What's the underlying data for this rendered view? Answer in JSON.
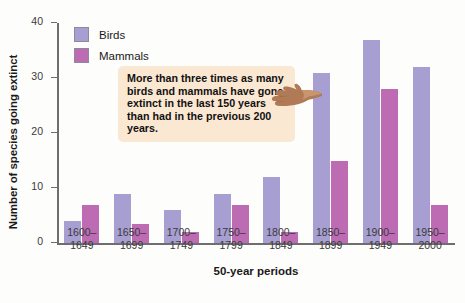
{
  "chart_data": {
    "type": "bar",
    "title": "",
    "xlabel": "50-year periods",
    "ylabel": "Number of species going extinct",
    "categories": [
      "1600–\n1649",
      "1650–\n1699",
      "1700–\n1749",
      "1750–\n1799",
      "1800–\n1849",
      "1850–\n1899",
      "1900–\n1949",
      "1950–\n2000"
    ],
    "series": [
      {
        "name": "Birds",
        "color": "#a79ed2",
        "values": [
          4,
          9,
          6,
          9,
          12,
          31,
          37,
          32
        ]
      },
      {
        "name": "Mammals",
        "color": "#bd6cb3",
        "values": [
          7,
          3.5,
          2,
          7,
          2,
          15,
          28,
          7
        ]
      }
    ],
    "ylim": [
      0,
      40
    ],
    "yticks": [
      0,
      10,
      20,
      30,
      40
    ],
    "ytick_labels": [
      "0",
      "10",
      "20",
      "30",
      "40"
    ],
    "grid": false,
    "legend_position": "top-left",
    "annotations": [
      {
        "text": "More than three times as many birds and mammals have gone extinct in the last 150 years than had in the previous 200 years.",
        "style": "callout-box",
        "background": "#fbe8d3",
        "pointer": "pointing-hand"
      }
    ]
  },
  "legend": {
    "items": [
      {
        "label": "Birds"
      },
      {
        "label": "Mammals"
      }
    ]
  },
  "axes": {
    "y_title": "Number of species going extinct",
    "x_title": "50-year periods"
  },
  "callout": {
    "text": "More than three times as many birds and mammals have gone extinct in the last 150 years than had in the previous 200 years."
  }
}
